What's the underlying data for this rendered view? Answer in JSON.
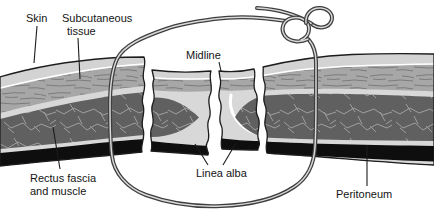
{
  "figure": {
    "background": "#ffffff",
    "labels": {
      "skin": "Skin",
      "subcutaneous_line1": "Subcutaneous",
      "subcutaneous_line2": "tissue",
      "midline": "Midline",
      "rectus_line1": "Rectus fascia",
      "rectus_line2": "and muscle",
      "linea_alba": "Linea alba",
      "peritoneum": "Peritoneum"
    },
    "icons": {
      "suture": "suture-thread",
      "knot": "suture-knot"
    },
    "colors": {
      "background": "#ffffff",
      "outline": "#1c1c1c",
      "skin_fill": "#d3d3d3",
      "subcut_fill": "#a7a7a7",
      "subcut_streak": "#7b7b7b",
      "fascia_fill": "#d8d8d8",
      "muscle_fill": "#606060",
      "muscle_vein": "#9e9e9e",
      "peritoneum_fill": "#0e0e0e",
      "suture_dark": "#3e3e3e",
      "suture_light": "#d8d8d8",
      "label_color": "#141414"
    }
  }
}
